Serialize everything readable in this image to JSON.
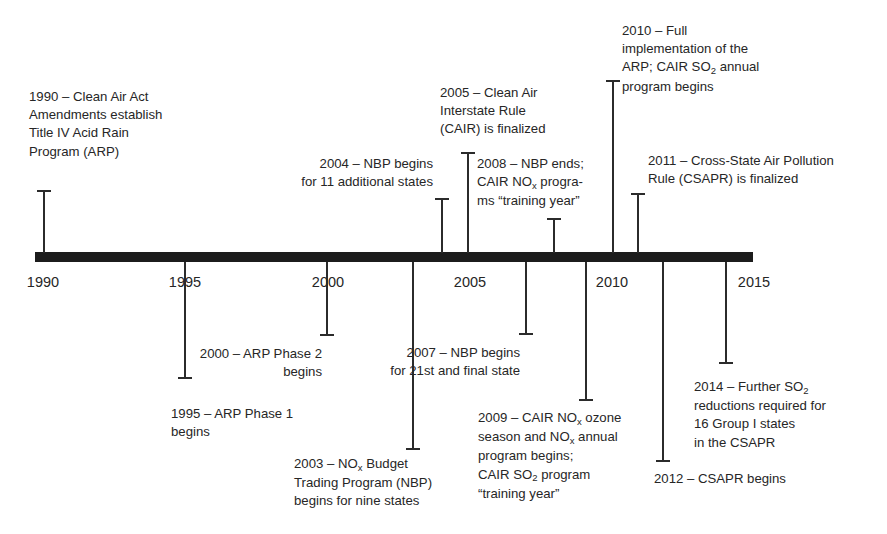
{
  "diagram": {
    "axis": {
      "start_year": 1990,
      "end_year": 2015,
      "tick_labels": [
        "1990",
        "1995",
        "2000",
        "2005",
        "2010",
        "2015"
      ],
      "bar_color": "#1c1c1c",
      "text_color": "#262626"
    },
    "events": [
      {
        "id": "e1990",
        "year": 1990,
        "side": "above",
        "label": "1990 – Clean Air Act\nAmendments establish\nTitle IV Acid Rain\nProgram (ARP)"
      },
      {
        "id": "e1995",
        "year": 1995,
        "side": "below",
        "label": "1995 – ARP Phase 1\nbegins"
      },
      {
        "id": "e2000",
        "year": 2000,
        "side": "below",
        "label": "2000 – ARP Phase 2\nbegins"
      },
      {
        "id": "e2003",
        "year": 2003,
        "side": "below",
        "label_pre": "2003 – NO",
        "label_sub": "x",
        "label_post": " Budget\nTrading Program (NBP)\nbegins for nine states"
      },
      {
        "id": "e2004",
        "year": 2004,
        "side": "above",
        "label": "2004 – NBP begins\nfor 11 additional states"
      },
      {
        "id": "e2005",
        "year": 2005,
        "side": "above",
        "label": "2005 – Clean Air\nInterstate Rule\n(CAIR) is finalized"
      },
      {
        "id": "e2007",
        "year": 2007,
        "side": "below",
        "label": "2007 – NBP begins\nfor 21st and final state"
      },
      {
        "id": "e2008",
        "year": 2008,
        "side": "above",
        "label_pre": "2008 – NBP ends;\nCAIR NO",
        "label_sub": "x",
        "label_post": " progra-\nms “training year”"
      },
      {
        "id": "e2009",
        "year": 2009,
        "side": "below",
        "label_pre": "2009 – CAIR NO",
        "label_sub": "x",
        "label_mid": " ozone\nseason and NO",
        "label_sub2": "x",
        "label_mid2": " annual\nprogram begins;\nCAIR SO",
        "label_sub3": "2",
        "label_post": " program\n“training year”"
      },
      {
        "id": "e2010",
        "year": 2010,
        "side": "above",
        "label_pre": "2010 – Full\nimplementation of the\nARP; CAIR SO",
        "label_sub": "2",
        "label_post": " annual\nprogram begins"
      },
      {
        "id": "e2011",
        "year": 2011,
        "side": "above",
        "label": "2011 – Cross-State Air Pollution\nRule (CSAPR) is finalized"
      },
      {
        "id": "e2012",
        "year": 2012,
        "side": "below",
        "label": "2012 – CSAPR begins"
      },
      {
        "id": "e2014",
        "year": 2014,
        "side": "below",
        "label_pre": "2014 – Further SO",
        "label_sub": "2",
        "label_post": "\nreductions required for\n16 Group I states\nin the CSAPR"
      }
    ]
  }
}
